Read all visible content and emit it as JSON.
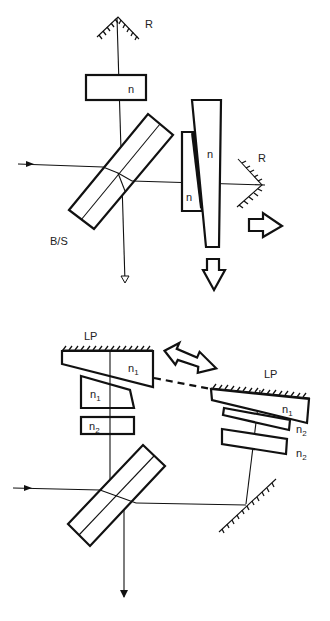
{
  "figure": {
    "top_panel": {
      "labels": {
        "mirror_top": "R",
        "mirror_right": "R",
        "compensator": "n",
        "wedge_large": "n",
        "wedge_small": "n",
        "beamsplitter": "B/S"
      },
      "motion_arrows": [
        "right",
        "down"
      ]
    },
    "bottom_panel": {
      "labels": {
        "lp_left": "LP",
        "lp_right": "LP",
        "left_wedge": "n",
        "left_wedge_sub": "1",
        "left_block": "n",
        "left_block_sub": "1",
        "left_plate": "n",
        "left_plate_sub": "2",
        "right_wedge": "n",
        "right_wedge_sub": "1",
        "right_plate1": "n",
        "right_plate1_sub": "2",
        "right_plate2": "n",
        "right_plate2_sub": "2"
      },
      "motion_arrows": [
        "bidirectional"
      ]
    }
  }
}
